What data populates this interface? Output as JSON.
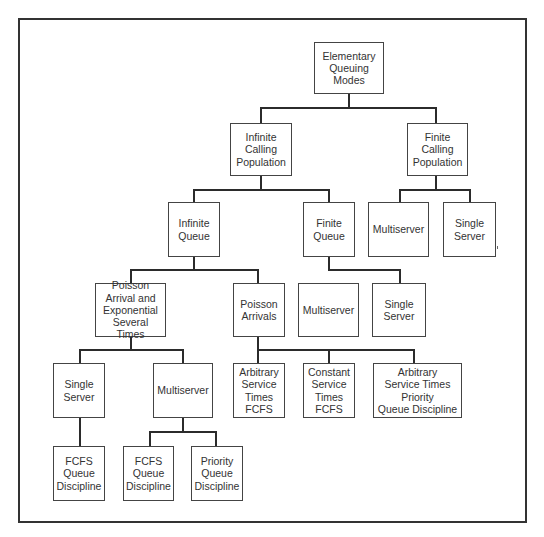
{
  "diagram": {
    "title": "Elementary Queuing Modes",
    "nodes": [
      {
        "id": "root",
        "label": "Elementary\nQueuing\nModes",
        "x": 314,
        "y": 42,
        "w": 70,
        "h": 52
      },
      {
        "id": "infinite-calling-population",
        "label": "Infinite\nCalling\nPopulation",
        "x": 230,
        "y": 123,
        "w": 62,
        "h": 53
      },
      {
        "id": "finite-calling-population",
        "label": "Finite\nCalling\nPopulation",
        "x": 407,
        "y": 123,
        "w": 61,
        "h": 53
      },
      {
        "id": "infinite-queue",
        "label": "Infinite\nQueue",
        "x": 168,
        "y": 202,
        "w": 52,
        "h": 55
      },
      {
        "id": "finite-queue",
        "label": "Finite\nQueue",
        "x": 303,
        "y": 202,
        "w": 52,
        "h": 55
      },
      {
        "id": "fcp-multiserver",
        "label": "Multiserver",
        "x": 368,
        "y": 202,
        "w": 61,
        "h": 55
      },
      {
        "id": "fcp-single-server",
        "label": "Single\nServer",
        "x": 443,
        "y": 202,
        "w": 53,
        "h": 55
      },
      {
        "id": "poisson-arrival-exponential",
        "label": "Poisson\nArrival and\nExponential\nSeveral Times",
        "x": 95,
        "y": 283,
        "w": 71,
        "h": 54
      },
      {
        "id": "poisson-arrivals",
        "label": "Poisson\nArrivals",
        "x": 233,
        "y": 283,
        "w": 52,
        "h": 54
      },
      {
        "id": "fq-multiserver",
        "label": "Multiserver",
        "x": 298,
        "y": 283,
        "w": 61,
        "h": 54
      },
      {
        "id": "fq-single-server",
        "label": "Single\nServer",
        "x": 372,
        "y": 283,
        "w": 54,
        "h": 54
      },
      {
        "id": "pae-single-server",
        "label": "Single\nServer",
        "x": 53,
        "y": 363,
        "w": 52,
        "h": 55
      },
      {
        "id": "pae-multiserver",
        "label": "Multiserver",
        "x": 153,
        "y": 363,
        "w": 60,
        "h": 55
      },
      {
        "id": "arbitrary-service-fcfs",
        "label": "Arbitrary\nService\nTimes\nFCFS",
        "x": 233,
        "y": 363,
        "w": 52,
        "h": 55
      },
      {
        "id": "constant-service-fcfs",
        "label": "Constant\nService\nTimes\nFCFS",
        "x": 303,
        "y": 363,
        "w": 52,
        "h": 55
      },
      {
        "id": "arbitrary-service-priority",
        "label": "Arbitrary\nService Times\nPriority\nQueue Discipline",
        "x": 373,
        "y": 363,
        "w": 89,
        "h": 55
      },
      {
        "id": "ss-fcfs-discipline",
        "label": "FCFS\nQueue\nDiscipline",
        "x": 53,
        "y": 446,
        "w": 52,
        "h": 55
      },
      {
        "id": "ms-fcfs-discipline",
        "label": "FCFS\nQueue\nDiscipline",
        "x": 123,
        "y": 446,
        "w": 51,
        "h": 55
      },
      {
        "id": "ms-priority-discipline",
        "label": "Priority\nQueue\nDiscipline",
        "x": 191,
        "y": 446,
        "w": 52,
        "h": 55
      }
    ],
    "edges": [
      {
        "parent": "root",
        "children": [
          "infinite-calling-population",
          "finite-calling-population"
        ]
      },
      {
        "parent": "infinite-calling-population",
        "children": [
          "infinite-queue",
          "finite-queue"
        ]
      },
      {
        "parent": "finite-calling-population",
        "children": [
          "fcp-multiserver",
          "fcp-single-server"
        ]
      },
      {
        "parent": "infinite-queue",
        "children": [
          "poisson-arrival-exponential",
          "poisson-arrivals"
        ]
      },
      {
        "parent": "finite-queue",
        "children": [
          "fq-multiserver",
          "fq-single-server"
        ]
      },
      {
        "parent": "poisson-arrival-exponential",
        "children": [
          "pae-single-server",
          "pae-multiserver"
        ]
      },
      {
        "parent": "poisson-arrivals",
        "children": [
          "arbitrary-service-fcfs",
          "constant-service-fcfs",
          "arbitrary-service-priority"
        ]
      },
      {
        "parent": "pae-single-server",
        "children": [
          "ss-fcfs-discipline"
        ]
      },
      {
        "parent": "pae-multiserver",
        "children": [
          "ms-fcfs-discipline",
          "ms-priority-discipline"
        ]
      }
    ],
    "connectors": [
      {
        "x1": 349,
        "y1": 94,
        "x2": 349,
        "y2": 108
      },
      {
        "x1": 261,
        "y1": 108,
        "x2": 436,
        "y2": 108
      },
      {
        "x1": 261,
        "y1": 108,
        "x2": 261,
        "y2": 123
      },
      {
        "x1": 436,
        "y1": 108,
        "x2": 436,
        "y2": 123
      },
      {
        "x1": 261,
        "y1": 176,
        "x2": 261,
        "y2": 190
      },
      {
        "x1": 194,
        "y1": 190,
        "x2": 329,
        "y2": 190
      },
      {
        "x1": 194,
        "y1": 190,
        "x2": 194,
        "y2": 202
      },
      {
        "x1": 329,
        "y1": 190,
        "x2": 329,
        "y2": 202
      },
      {
        "x1": 436,
        "y1": 176,
        "x2": 436,
        "y2": 190
      },
      {
        "x1": 400,
        "y1": 190,
        "x2": 470,
        "y2": 190
      },
      {
        "x1": 400,
        "y1": 190,
        "x2": 400,
        "y2": 202
      },
      {
        "x1": 470,
        "y1": 190,
        "x2": 470,
        "y2": 202
      },
      {
        "x1": 194,
        "y1": 257,
        "x2": 194,
        "y2": 270
      },
      {
        "x1": 131,
        "y1": 270,
        "x2": 258,
        "y2": 270
      },
      {
        "x1": 131,
        "y1": 270,
        "x2": 131,
        "y2": 283
      },
      {
        "x1": 258,
        "y1": 270,
        "x2": 258,
        "y2": 283
      },
      {
        "x1": 329,
        "y1": 257,
        "x2": 329,
        "y2": 270
      },
      {
        "x1": 329,
        "y1": 270,
        "x2": 400,
        "y2": 270
      },
      {
        "x1": 400,
        "y1": 270,
        "x2": 400,
        "y2": 283
      },
      {
        "x1": 131,
        "y1": 337,
        "x2": 131,
        "y2": 350
      },
      {
        "x1": 80,
        "y1": 350,
        "x2": 183,
        "y2": 350
      },
      {
        "x1": 80,
        "y1": 350,
        "x2": 80,
        "y2": 363
      },
      {
        "x1": 183,
        "y1": 350,
        "x2": 183,
        "y2": 363
      },
      {
        "x1": 258,
        "y1": 337,
        "x2": 258,
        "y2": 363
      },
      {
        "x1": 258,
        "y1": 350,
        "x2": 414,
        "y2": 350
      },
      {
        "x1": 329,
        "y1": 350,
        "x2": 329,
        "y2": 363
      },
      {
        "x1": 414,
        "y1": 350,
        "x2": 414,
        "y2": 363
      },
      {
        "x1": 80,
        "y1": 418,
        "x2": 80,
        "y2": 446
      },
      {
        "x1": 183,
        "y1": 418,
        "x2": 183,
        "y2": 432
      },
      {
        "x1": 150,
        "y1": 432,
        "x2": 216,
        "y2": 432
      },
      {
        "x1": 150,
        "y1": 432,
        "x2": 150,
        "y2": 446
      },
      {
        "x1": 216,
        "y1": 432,
        "x2": 216,
        "y2": 446
      }
    ],
    "colors": {
      "line": "#2b2b2b",
      "border": "#444444",
      "background": "#ffffff"
    }
  }
}
